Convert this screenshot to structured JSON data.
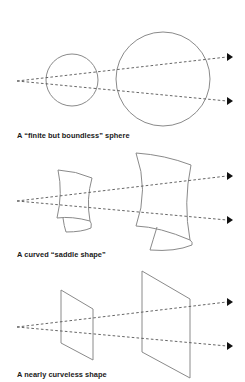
{
  "figure": {
    "colors": {
      "background": "#ffffff",
      "shape_stroke": "#8a8a8a",
      "ray_stroke": "#555555",
      "arrowhead": "#111111",
      "caption_text": "#1a1a1a"
    },
    "panels": [
      {
        "id": "sphere",
        "caption": "A “finite but boundless” sphere",
        "shape_type": "circle",
        "origin": [
          17,
          81
        ],
        "arrow_tips": [
          [
            233,
            57
          ],
          [
            233,
            101
          ]
        ],
        "small_shape": {
          "cx": 72,
          "cy": 80,
          "r": 26
        },
        "large_shape": {
          "cx": 163,
          "cy": 79,
          "r": 47
        }
      },
      {
        "id": "saddle",
        "caption": "A curved “saddle shape”",
        "shape_type": "saddle",
        "origin": [
          17,
          201
        ],
        "arrow_tips": [
          [
            233,
            176
          ],
          [
            233,
            220
          ]
        ]
      },
      {
        "id": "plane",
        "caption": "A nearly curveless shape",
        "shape_type": "plane",
        "origin": [
          17,
          327
        ],
        "arrow_tips": [
          [
            233,
            302
          ],
          [
            233,
            346
          ]
        ],
        "small_shape": {
          "points": "61,290 93,309 93,360 61,343"
        },
        "large_shape": {
          "points": "142,271 190,299 190,378 142,352"
        }
      }
    ]
  }
}
